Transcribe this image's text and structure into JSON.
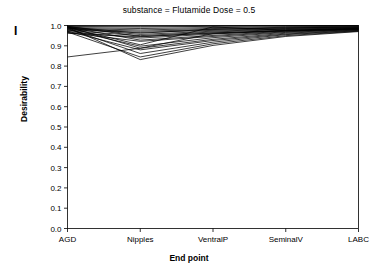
{
  "panel": {
    "label": "I"
  },
  "chart_data": {
    "type": "line",
    "subtype": "parallel-coordinates",
    "title": "substance = Flutamide  Dose = 0.5",
    "title_parts": {
      "substance_key": "substance",
      "substance_value": "Flutamide",
      "dose_key": "Dose",
      "dose_value": "0.5"
    },
    "xlabel": "End point",
    "ylabel": "Desirability",
    "categories": [
      "AGD",
      "Nipples",
      "VentralP",
      "SeminalV",
      "LABC"
    ],
    "ylim": [
      0.0,
      1.0
    ],
    "yticks": [
      "0.0",
      "0.1",
      "0.2",
      "0.3",
      "0.4",
      "0.5",
      "0.6",
      "0.7",
      "0.8",
      "0.9",
      "1.0"
    ],
    "ytick_values": [
      0.0,
      0.1,
      0.2,
      0.3,
      0.4,
      0.5,
      0.6,
      0.7,
      0.8,
      0.9,
      1.0
    ],
    "grid": false,
    "legend": "none",
    "line_color": "#000000",
    "series": [
      {
        "name": "curve-01",
        "values": [
          0.995,
          0.992,
          0.996,
          0.998,
          0.999
        ]
      },
      {
        "name": "curve-02",
        "values": [
          0.99,
          0.985,
          0.99,
          0.994,
          0.996
        ]
      },
      {
        "name": "curve-03",
        "values": [
          0.986,
          0.978,
          0.985,
          0.991,
          0.994
        ]
      },
      {
        "name": "curve-04",
        "values": [
          0.982,
          0.972,
          0.98,
          0.988,
          0.992
        ]
      },
      {
        "name": "curve-05",
        "values": [
          0.978,
          0.966,
          0.976,
          0.985,
          0.99
        ]
      },
      {
        "name": "curve-06",
        "values": [
          0.993,
          0.962,
          0.982,
          0.988,
          0.993
        ]
      },
      {
        "name": "curve-07",
        "values": [
          0.988,
          0.956,
          0.972,
          0.982,
          0.989
        ]
      },
      {
        "name": "curve-08",
        "values": [
          0.975,
          0.95,
          0.968,
          0.98,
          0.987
        ]
      },
      {
        "name": "curve-09",
        "values": [
          0.996,
          0.946,
          0.962,
          0.977,
          0.986
        ]
      },
      {
        "name": "curve-10",
        "values": [
          0.97,
          0.938,
          0.958,
          0.975,
          0.984
        ]
      },
      {
        "name": "curve-11",
        "values": [
          0.992,
          0.928,
          0.951,
          0.972,
          0.983
        ]
      },
      {
        "name": "curve-12",
        "values": [
          0.965,
          0.922,
          0.946,
          0.969,
          0.981
        ]
      },
      {
        "name": "curve-13",
        "values": [
          0.989,
          0.905,
          0.993,
          0.976,
          0.985
        ]
      },
      {
        "name": "curve-14",
        "values": [
          0.98,
          0.898,
          0.94,
          0.966,
          0.98
        ]
      },
      {
        "name": "curve-15",
        "values": [
          0.994,
          0.888,
          0.932,
          0.962,
          0.978
        ]
      },
      {
        "name": "curve-16",
        "values": [
          0.972,
          0.88,
          0.926,
          0.958,
          0.976
        ]
      },
      {
        "name": "curve-17",
        "values": [
          0.985,
          0.862,
          0.918,
          0.955,
          0.974
        ]
      },
      {
        "name": "curve-18",
        "values": [
          0.968,
          0.845,
          0.91,
          0.95,
          0.972
        ]
      },
      {
        "name": "curve-19",
        "values": [
          0.991,
          0.832,
          0.902,
          0.946,
          0.97
        ]
      },
      {
        "name": "curve-20",
        "values": [
          0.845,
          0.888,
          0.96,
          0.973,
          0.982
        ]
      },
      {
        "name": "curve-21",
        "values": [
          0.962,
          0.944,
          0.964,
          0.974,
          0.982
        ]
      },
      {
        "name": "curve-22",
        "values": [
          0.998,
          0.996,
          0.998,
          0.999,
          1.0
        ]
      }
    ]
  }
}
